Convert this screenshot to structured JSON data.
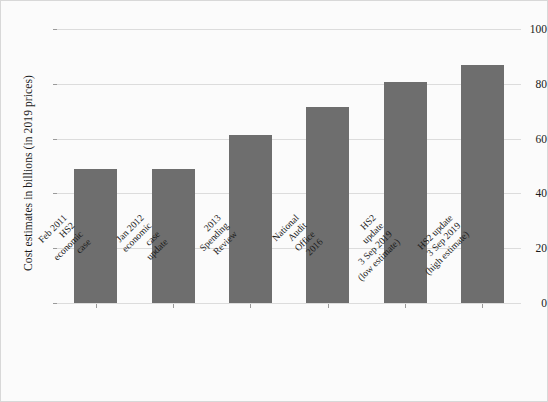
{
  "chart_data": {
    "type": "bar",
    "title": "",
    "xlabel": "",
    "ylabel": "Cost estimates in billions (in 2019 prices)",
    "ylim": [
      0,
      100
    ],
    "yticks": [
      0,
      20,
      40,
      60,
      80,
      100
    ],
    "grid": true,
    "legend": "none",
    "bar_color": "#6e6e6e",
    "categories": [
      "Feb 2011 HS2 economic case",
      "Jan 2012 economic case update",
      "2013 Spending Review",
      "National Audit Office 2016",
      "HS2 update 3 Sep 2019 (low estimate)",
      "HS2 update 3 Sep 2019 (high estimate)"
    ],
    "category_lines": [
      [
        "Feb 2011",
        "HS2",
        "economic",
        "case"
      ],
      [
        "Jan 2012",
        "economic",
        "case",
        "update"
      ],
      [
        "2013",
        "Spending",
        "Review"
      ],
      [
        "National",
        "Audit",
        "Office",
        "2016"
      ],
      [
        "HS2",
        "update",
        "3 Sep 2019",
        "(low estimate)"
      ],
      [
        "HS2 update",
        "3 Sep 2019",
        "(high estimate)"
      ]
    ],
    "values": [
      49,
      48.8,
      61.2,
      71.6,
      80.7,
      87
    ]
  },
  "axis": {
    "ytick_labels": [
      "0",
      "20",
      "40",
      "60",
      "80",
      "100"
    ]
  }
}
